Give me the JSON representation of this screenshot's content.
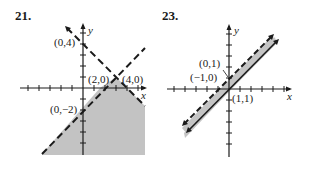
{
  "problems": [
    {
      "number": "21.",
      "axis_labels": {
        "x": "x",
        "y": "y"
      },
      "points": [
        {
          "label": "(0,4)"
        },
        {
          "label": "(2,0)"
        },
        {
          "label": "(4,0)"
        },
        {
          "label": "(0,−2)"
        }
      ],
      "boundaries": [
        {
          "equation": "x + y = 4",
          "style": "dashed"
        },
        {
          "equation": "y = x − 2",
          "style": "dashed"
        }
      ],
      "shaded_region": "below both lines",
      "colors": {
        "shade": "#b8b8b8",
        "line": "#1a1a1a"
      }
    },
    {
      "number": "23.",
      "axis_labels": {
        "x": "x",
        "y": "y"
      },
      "points": [
        {
          "label": "(0,1)"
        },
        {
          "label": "(−1,0)"
        },
        {
          "label": "(1,1)"
        }
      ],
      "boundaries": [
        {
          "equation": "y = x + 1",
          "style": "dashed"
        },
        {
          "equation": "y = x",
          "style": "solid"
        }
      ],
      "shaded_region": "between the lines",
      "colors": {
        "shade": "#c4c4c4",
        "line": "#1a1a1a"
      }
    }
  ]
}
